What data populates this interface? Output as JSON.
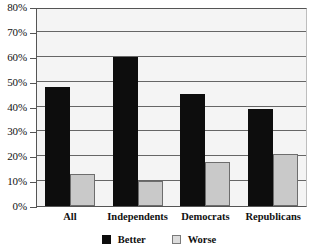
{
  "chart_data": {
    "type": "bar",
    "title": "",
    "subtitle": "",
    "xlabel": "",
    "ylabel": "",
    "categories": [
      "All",
      "Independents",
      "Democrats",
      "Republicans"
    ],
    "series": [
      {
        "name": "Better",
        "color": "#0d0d0d",
        "values": [
          48,
          60,
          45,
          39
        ]
      },
      {
        "name": "Worse",
        "color": "#c9c9c9",
        "values": [
          13,
          10,
          17.5,
          21
        ]
      }
    ],
    "ylim": [
      0,
      80
    ],
    "ytick_step": 10,
    "ytick_labels": [
      "0%",
      "10%",
      "20%",
      "30%",
      "40%",
      "50%",
      "60%",
      "70%",
      "80%"
    ],
    "ytick_values": [
      0,
      10,
      20,
      30,
      40,
      50,
      60,
      70,
      80
    ],
    "grid": true,
    "grid_axis": "y",
    "legend_position": "bottom",
    "legend_entries": [
      "Better",
      "Worse"
    ],
    "annotations": []
  },
  "colors": {
    "better": "#0d0d0d",
    "worse_fill": "#c9c9c9",
    "worse_border": "#6d6d6d",
    "plot_background": "#f4f4f4",
    "gridline": "#666666",
    "axis": "#555555",
    "text": "#111111"
  }
}
